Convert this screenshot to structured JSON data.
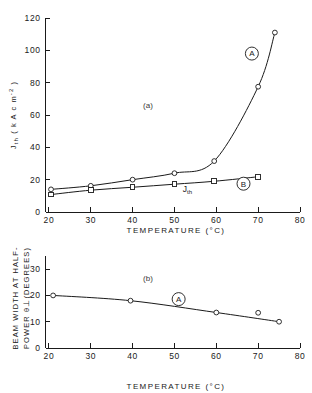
{
  "figure": {
    "background_color": "#ffffff",
    "ink_color": "#1a1a1a",
    "width": 312,
    "height": 393
  },
  "chart_data": [
    {
      "type": "line",
      "panel": "(a)",
      "title": "",
      "xlabel": "TEMPERATURE (°C)",
      "ylabel": "J_th ( kA cm^-2 )",
      "ylabel_parts": {
        "main": "J",
        "main_sub": "th",
        "unit_open": " ( k A c m",
        "unit_sup": "-2",
        "unit_close": " )"
      },
      "xlim": [
        15,
        80
      ],
      "ylim": [
        0,
        120
      ],
      "xticks": [
        20,
        30,
        40,
        50,
        60,
        70,
        80
      ],
      "yticks": [
        0,
        20,
        40,
        60,
        80,
        100,
        120
      ],
      "xtick_labels": [
        "20",
        "30",
        "40",
        "50",
        "60",
        "70",
        "80"
      ],
      "ytick_labels": [
        "0",
        "20",
        "40",
        "60",
        "80",
        "100",
        "120"
      ],
      "grid": false,
      "legend_position": "inline-callout",
      "series": [
        {
          "name": "A",
          "marker": "circle",
          "callout_label": "A",
          "callout_x": 68.5,
          "callout_y": 98,
          "x": [
            20.5,
            30,
            40,
            50,
            59.5,
            70,
            74
          ],
          "y": [
            14,
            16.2,
            20,
            24,
            31.5,
            77.5,
            111
          ]
        },
        {
          "name": "B",
          "marker": "square",
          "callout_label": "B",
          "callout_x": 66.5,
          "callout_y": 17.5,
          "inline_label": "J_th",
          "inline_label_parts": {
            "main": "J",
            "sub": "th"
          },
          "inline_label_x": 52,
          "inline_label_y": 12.6,
          "x": [
            20.5,
            30,
            40,
            50,
            59.5,
            70
          ],
          "y": [
            10.8,
            13.5,
            15.3,
            17.2,
            19,
            21.8
          ]
        }
      ]
    },
    {
      "type": "line",
      "panel": "(b)",
      "title": "",
      "xlabel": "TEMPERATURE (°C)",
      "ylabel": "BEAM WIDTH AT HALF-POWER θ⊥ (DEGREES)",
      "ylabel_lines": [
        "BEAM WIDTH AT HALF-",
        "POWER θ⊥(DEGREES)"
      ],
      "xlim": [
        15,
        80
      ],
      "ylim": [
        0,
        35
      ],
      "xticks": [
        20,
        30,
        40,
        50,
        60,
        70,
        80
      ],
      "yticks": [
        0,
        10,
        20,
        30
      ],
      "xtick_labels": [
        "20",
        "30",
        "40",
        "50",
        "60",
        "70",
        "80"
      ],
      "ytick_labels": [
        "0",
        "10",
        "20",
        "30"
      ],
      "grid": false,
      "legend_position": "inline-callout",
      "series": [
        {
          "name": "A",
          "marker": "circle",
          "callout_label": "A",
          "callout_x": 51,
          "callout_y": 18.6,
          "x": [
            21,
            39.5,
            60,
            70,
            75
          ],
          "y": [
            20,
            18,
            13.5,
            13.4,
            10
          ],
          "curve_x": [
            21,
            39.5,
            60,
            75
          ],
          "curve_y": [
            20,
            18,
            13.5,
            10
          ]
        }
      ]
    }
  ]
}
